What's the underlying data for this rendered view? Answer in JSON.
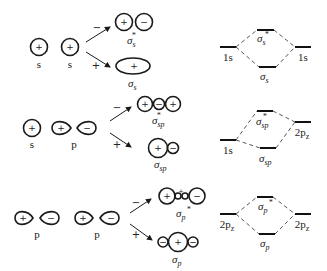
{
  "diagram": {
    "rows": [
      {
        "id": "s-s",
        "atomic_orbitals": [
          {
            "label": "s",
            "lobes": [
              "+"
            ]
          },
          {
            "label": "s",
            "lobes": [
              "+"
            ]
          }
        ],
        "combinations": {
          "minus": "−",
          "plus": "+"
        },
        "antibonding": {
          "label": "σ",
          "sub": "s",
          "sup": "*",
          "lobes": [
            "+",
            "−"
          ]
        },
        "bonding": {
          "label": "σ",
          "sub": "s",
          "lobes": [
            "+"
          ]
        },
        "energy_diagram": {
          "left_level": "1s",
          "right_level": "1s",
          "upper_mo": {
            "label": "σ",
            "sub": "s",
            "sup": "*"
          },
          "lower_mo": {
            "label": "σ",
            "sub": "s"
          }
        }
      },
      {
        "id": "s-p",
        "atomic_orbitals": [
          {
            "label": "s",
            "lobes": [
              "+"
            ]
          },
          {
            "label": "p",
            "lobes": [
              "+",
              "−"
            ]
          }
        ],
        "combinations": {
          "minus": "−",
          "plus": "+"
        },
        "antibonding": {
          "label": "σ",
          "sub": "sp",
          "sup": "*",
          "lobes": [
            "+",
            "−",
            "+"
          ]
        },
        "bonding": {
          "label": "σ",
          "sub": "sp",
          "lobes": [
            "+",
            "−"
          ]
        },
        "energy_diagram": {
          "left_level": "1s",
          "right_level": "2p",
          "right_level_sub": "z",
          "upper_mo": {
            "label": "σ",
            "sub": "sp",
            "sup": "*"
          },
          "lower_mo": {
            "label": "σ",
            "sub": "sp"
          }
        }
      },
      {
        "id": "p-p",
        "atomic_orbitals": [
          {
            "label": "p",
            "lobes": [
              "+",
              "−"
            ]
          },
          {
            "label": "p",
            "lobes": [
              "+",
              "−"
            ]
          }
        ],
        "combinations": {
          "minus": "−",
          "plus": "+"
        },
        "antibonding": {
          "label": "σ",
          "sub": "p",
          "sup": "*",
          "lobes": [
            "+",
            "−",
            "+",
            "−"
          ]
        },
        "bonding": {
          "label": "σ",
          "sub": "p",
          "lobes": [
            "−",
            "+",
            "−"
          ]
        },
        "energy_diagram": {
          "left_level": "2p",
          "left_level_sub": "z",
          "right_level": "2p",
          "right_level_sub": "z",
          "upper_mo": {
            "label": "σ",
            "sub": "p",
            "sup": "*"
          },
          "lower_mo": {
            "label": "σ",
            "sub": "p"
          }
        }
      }
    ]
  }
}
